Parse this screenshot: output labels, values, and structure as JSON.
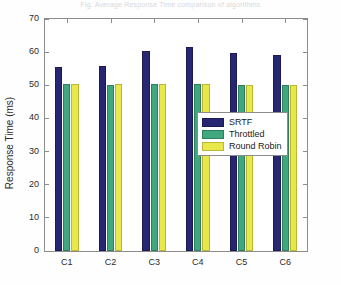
{
  "figure": {
    "title_faint": "Fig. Average Response Time comparison of algorithms",
    "background": "#ffffff"
  },
  "axes": {
    "ylabel": "Response Time (ms)",
    "xlabel": "",
    "yticks": [
      0,
      10,
      20,
      30,
      40,
      50,
      60,
      70
    ],
    "ytick_labels": [
      "0",
      "10",
      "20",
      "30",
      "40",
      "50",
      "60",
      "70"
    ],
    "ylim": [
      0,
      70
    ],
    "xtick_labels": [
      "C1",
      "C2",
      "C3",
      "C4",
      "C5",
      "C6"
    ],
    "axis_color": "#8c8c8c",
    "grid": false
  },
  "legend": {
    "position": "center-right-inside",
    "entries": [
      {
        "label": "SRTF",
        "color": "#262673",
        "edge": "#1b1b52"
      },
      {
        "label": "Throttled",
        "color": "#3fa87f",
        "edge": "#2e7f60"
      },
      {
        "label": "Round Robin",
        "color": "#e8e84a",
        "edge": "#b8b836"
      }
    ]
  },
  "chart_data": {
    "type": "bar",
    "title": "Fig. Average Response Time comparison of algorithms",
    "xlabel": "",
    "ylabel": "Response Time (ms)",
    "ylim": [
      0,
      70
    ],
    "yticks": [
      0,
      10,
      20,
      30,
      40,
      50,
      60,
      70
    ],
    "grid": false,
    "legend_position": "center right (inside axes)",
    "categories": [
      "C1",
      "C2",
      "C3",
      "C4",
      "C5",
      "C6"
    ],
    "series": [
      {
        "name": "SRTF",
        "color": "#262673",
        "values": [
          55.5,
          55.7,
          60.3,
          61.5,
          59.8,
          59.1
        ]
      },
      {
        "name": "Throttled",
        "color": "#3fa87f",
        "values": [
          50.3,
          50.2,
          50.4,
          50.3,
          50.0,
          50.1
        ]
      },
      {
        "name": "Round Robin",
        "color": "#e8e84a",
        "values": [
          50.3,
          50.4,
          50.4,
          50.4,
          50.2,
          50.0
        ]
      }
    ]
  }
}
